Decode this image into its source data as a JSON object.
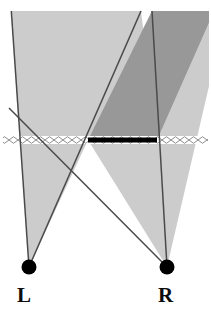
{
  "figure": {
    "kind": "stereo-viewing-cone-diagram",
    "width": 211,
    "height": 314,
    "background_color": "#ffffff",
    "labels": {
      "left_eye": "L",
      "right_eye": "R"
    },
    "colors": {
      "left_cone_fill": "#cccccc",
      "right_cone_fill": "#cccccc",
      "overlap_fill": "#989898",
      "ray_stroke": "#4a4a4a",
      "bar_fill": "#000000",
      "eye_dot_fill": "#000000",
      "plane_stroke": "#8a8a8a",
      "label_color": "#0d0d0d"
    },
    "eyes": [
      {
        "name": "L",
        "cx": 29,
        "cy": 267,
        "r": 7.5
      },
      {
        "name": "R",
        "cx": 167,
        "cy": 267,
        "r": 7.5
      }
    ],
    "fixation_plane": {
      "y": 140,
      "x_start": 3,
      "x_end": 208,
      "pattern": "diamond-chain-hatch",
      "diamond_width": 9,
      "diamond_height": 7
    },
    "stimulus_bar": {
      "x_start": 88,
      "x_end": 157,
      "y": 140,
      "thickness": 5
    },
    "left_cone": {
      "apex_x": 29,
      "apex_y": 267,
      "polygon": "29,267 12,11 137,11 137,45 157,140 88,140"
    },
    "right_cone": {
      "apex_x": 167,
      "apex_y": 267,
      "polygon": "167,267 88,140 137,45 155,11 208,11 208,86"
    },
    "overlap_region": {
      "apex_x": 137,
      "apex_y": 45,
      "lower_apex_x": 120,
      "lower_apex_y": 176
    },
    "rays": [
      {
        "from": "L",
        "x1": 29,
        "y1": 267,
        "x2": 12,
        "y2": 11
      },
      {
        "from": "L",
        "x1": 29,
        "y1": 267,
        "x2": 140,
        "y2": 11
      },
      {
        "from": "R",
        "x1": 167,
        "y1": 267,
        "x2": 152,
        "y2": 11
      },
      {
        "from": "R",
        "x1": 167,
        "y1": 267,
        "x2": 9,
        "y2": 110
      }
    ]
  }
}
